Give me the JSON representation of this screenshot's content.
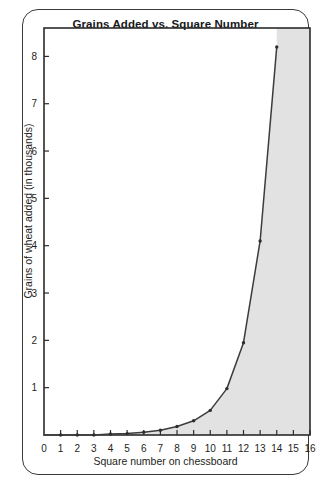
{
  "chart_data": {
    "type": "line",
    "title": "Grains Added vs. Square Number",
    "xlabel": "Square number on chessboard",
    "ylabel": "Grains of wheat added (in thousands)",
    "xlim": [
      0,
      16
    ],
    "ylim": [
      0,
      8.6
    ],
    "grid": false,
    "legend": "none",
    "fill": "area-right-of-curve",
    "fill_color": "#e2e2e2",
    "line_color": "#3c3c3c",
    "marker": "dot",
    "xticks": [
      "0",
      "1",
      "2",
      "3",
      "4",
      "5",
      "6",
      "7",
      "8",
      "9",
      "10",
      "11",
      "12",
      "13",
      "14",
      "15",
      "16"
    ],
    "yticks": [
      "1",
      "2",
      "3",
      "4",
      "5",
      "6",
      "7",
      "8"
    ],
    "x": [
      1,
      2,
      3,
      4,
      5,
      6,
      7,
      8,
      9,
      10,
      11,
      12,
      13,
      14
    ],
    "values": [
      0.0,
      0.0,
      0.0,
      0.001,
      0.002,
      0.003,
      0.006,
      0.013,
      0.026,
      0.051,
      0.102,
      0.205,
      0.41,
      0.82
    ],
    "series": [
      {
        "name": "Grains added",
        "values": [
          0.0,
          0.0,
          0.0,
          0.001,
          0.002,
          0.003,
          0.006,
          0.013,
          0.026,
          0.051,
          0.102,
          0.205,
          0.41,
          0.82
        ]
      }
    ],
    "plotted_points": [
      {
        "x": 1,
        "y": 0.0
      },
      {
        "x": 2,
        "y": 0.0
      },
      {
        "x": 3,
        "y": 0.0
      },
      {
        "x": 4,
        "y": 0.02
      },
      {
        "x": 5,
        "y": 0.03
      },
      {
        "x": 6,
        "y": 0.06
      },
      {
        "x": 7,
        "y": 0.1
      },
      {
        "x": 8,
        "y": 0.18
      },
      {
        "x": 9,
        "y": 0.3
      },
      {
        "x": 10,
        "y": 0.52
      },
      {
        "x": 11,
        "y": 0.98
      },
      {
        "x": 12,
        "y": 1.95
      },
      {
        "x": 13,
        "y": 4.1
      },
      {
        "x": 14,
        "y": 8.2
      }
    ]
  }
}
